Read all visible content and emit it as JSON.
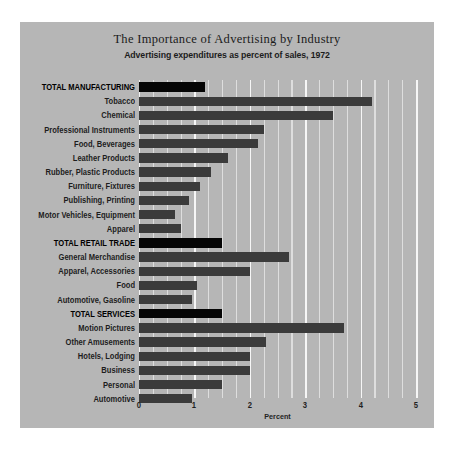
{
  "chart_data": {
    "type": "bar",
    "orientation": "horizontal",
    "title": "The Importance of Advertising by Industry",
    "subtitle": "Advertising expenditures as percent of sales, 1972",
    "xlabel": "Percent",
    "ylabel": "",
    "xlim": [
      0,
      5
    ],
    "xticks": [
      0,
      1,
      2,
      3,
      4,
      5
    ],
    "xtick_labels": [
      "0",
      "1",
      "2",
      "3",
      "4",
      "5"
    ],
    "grid": "vertical-minor-and-major",
    "legend": "none",
    "categories": [
      "TOTAL MANUFACTURING",
      "Tobacco",
      "Chemical",
      "Professional Instruments",
      "Food, Beverages",
      "Leather Products",
      "Rubber, Plastic Products",
      "Furniture, Fixtures",
      "Publishing, Printing",
      "Motor Vehicles, Equipment",
      "Apparel",
      "TOTAL RETAIL TRADE",
      "General Merchandise",
      "Apparel, Accessories",
      "Food",
      "Automotive, Gasoline",
      "TOTAL SERVICES",
      "Motion Pictures",
      "Other Amusements",
      "Hotels, Lodging",
      "Business",
      "Personal",
      "Automotive"
    ],
    "values": [
      1.2,
      4.2,
      3.5,
      2.25,
      2.15,
      1.6,
      1.3,
      1.1,
      0.9,
      0.65,
      0.75,
      1.5,
      2.7,
      2.0,
      1.05,
      0.95,
      1.5,
      3.7,
      2.3,
      2.0,
      2.0,
      1.5,
      0.95
    ],
    "total_rows": [
      0,
      11,
      16
    ],
    "colors": {
      "panel_background": "#b6b6b6",
      "bar": "#3b3b3b",
      "bar_total": "#050505",
      "gridline_major": "#f6f6f6",
      "gridline_minor": "#dedede",
      "text": "#1d1d1d",
      "page_background": "#ffffff"
    }
  }
}
